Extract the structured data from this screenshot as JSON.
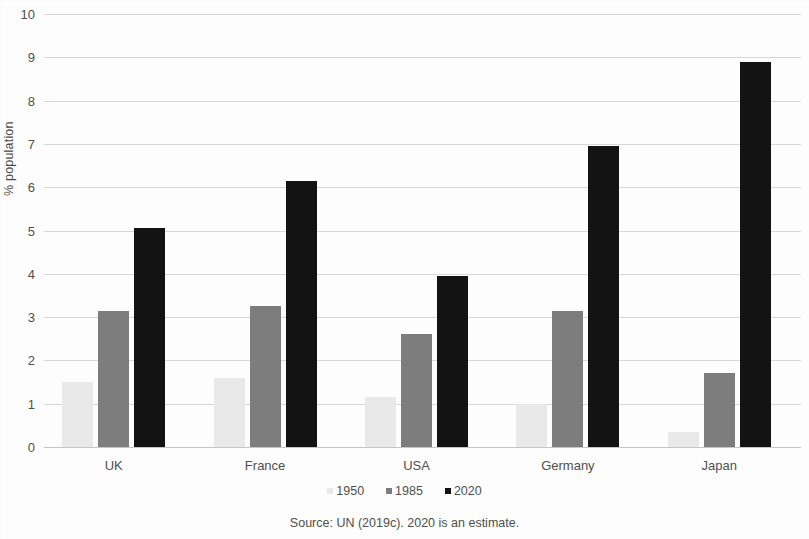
{
  "chart_data": {
    "type": "bar",
    "title": "",
    "subtitle": "",
    "xlabel": "",
    "ylabel": "% population",
    "categories": [
      "UK",
      "France",
      "USA",
      "Germany",
      "Japan"
    ],
    "series": [
      {
        "name": "1950",
        "color": "#e9e9e9",
        "values": [
          1.5,
          1.6,
          1.15,
          1.0,
          0.35
        ]
      },
      {
        "name": "1985",
        "color": "#7d7d7d",
        "values": [
          3.15,
          3.25,
          2.6,
          3.15,
          1.7
        ]
      },
      {
        "name": "2020",
        "color": "#131313",
        "values": [
          5.05,
          6.15,
          3.95,
          6.95,
          8.9
        ]
      }
    ],
    "ylim": [
      0,
      10
    ],
    "yticks": [
      0,
      1,
      2,
      3,
      4,
      5,
      6,
      7,
      8,
      9,
      10
    ],
    "ytick_labels": [
      "0",
      "1",
      "2",
      "3",
      "4",
      "5",
      "6",
      "7",
      "8",
      "9",
      "10"
    ],
    "grid": true,
    "grid_color": "#d8d8d8",
    "legend_position": "bottom",
    "source_note": "Source: UN (2019c). 2020 is an estimate.",
    "background_color": "#fdfdfd"
  }
}
